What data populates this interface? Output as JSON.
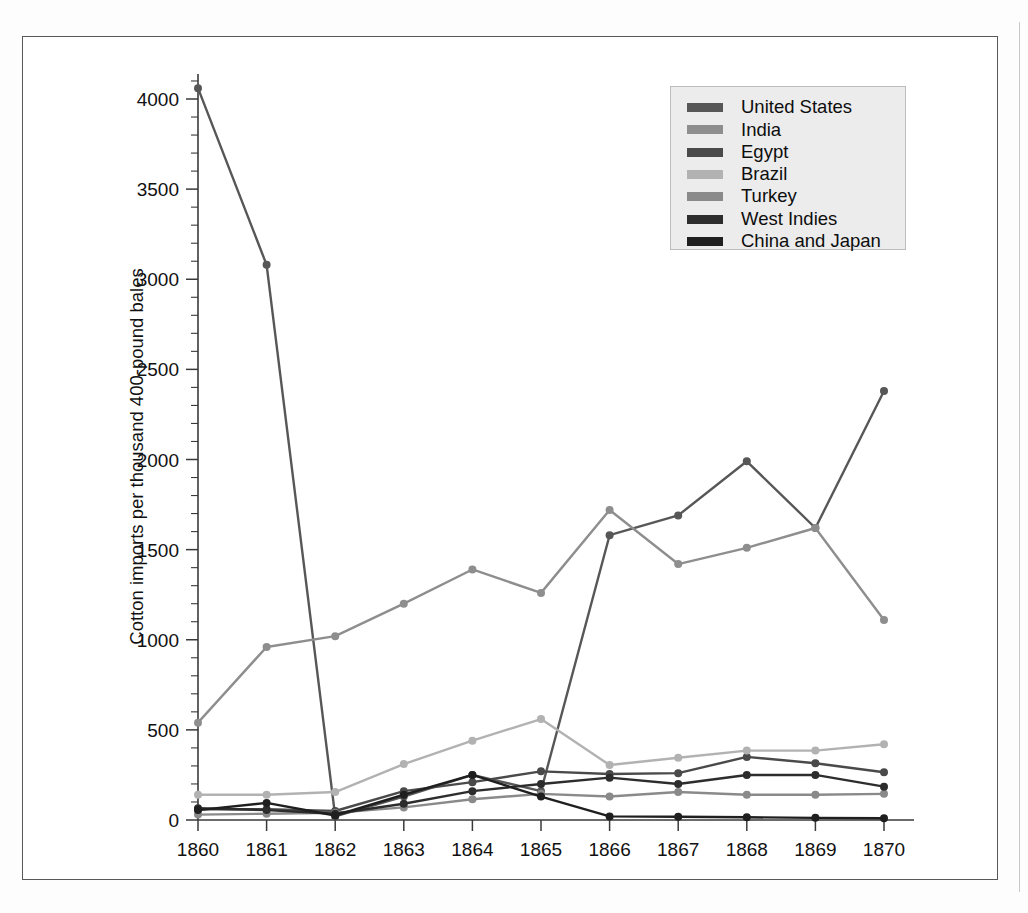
{
  "figure": {
    "frame_color": "#58595b",
    "background": "#ffffff"
  },
  "legend": {
    "position": "top-right",
    "background": "#ececec",
    "border": "#bdbdbd",
    "entries": [
      {
        "label": "United States",
        "color": "#575757"
      },
      {
        "label": "India",
        "color": "#8e8e8e"
      },
      {
        "label": "Egypt",
        "color": "#4a4a4a"
      },
      {
        "label": "Brazil",
        "color": "#b2b2b2"
      },
      {
        "label": "Turkey",
        "color": "#8a8a8a"
      },
      {
        "label": "West Indies",
        "color": "#2d2d2d"
      },
      {
        "label": "China and Japan",
        "color": "#1f1f1f"
      }
    ]
  },
  "axes": {
    "y_title": "Cotton imports per thousand 400-pound bales",
    "y_ticks": [
      "0",
      "500",
      "1000",
      "1500",
      "2000",
      "2500",
      "3000",
      "3500",
      "4000"
    ],
    "x_ticks": [
      "1860",
      "1861",
      "1862",
      "1863",
      "1864",
      "1865",
      "1866",
      "1867",
      "1868",
      "1869",
      "1870"
    ]
  },
  "chart_data": {
    "type": "line",
    "title": "",
    "xlabel": "",
    "ylabel": "Cotton imports per thousand 400-pound bales",
    "categories": [
      "1860",
      "1861",
      "1862",
      "1863",
      "1864",
      "1865",
      "1866",
      "1867",
      "1868",
      "1869",
      "1870"
    ],
    "x": [
      1860,
      1861,
      1862,
      1863,
      1864,
      1865,
      1866,
      1867,
      1868,
      1869,
      1870
    ],
    "xlim": [
      1860,
      1870
    ],
    "ylim": [
      0,
      4200
    ],
    "y_tick_step": 500,
    "y_minor_tick_step": 100,
    "grid": false,
    "legend_position": "upper right",
    "series": [
      {
        "name": "United States",
        "color": "#575757",
        "values": [
          4060,
          3080,
          20,
          130,
          250,
          160,
          1580,
          1690,
          1990,
          1620,
          2380
        ]
      },
      {
        "name": "India",
        "color": "#8e8e8e",
        "values": [
          540,
          960,
          1020,
          1200,
          1390,
          1260,
          1720,
          1420,
          1510,
          1620,
          1110
        ]
      },
      {
        "name": "Egypt",
        "color": "#4a4a4a",
        "values": [
          60,
          60,
          50,
          160,
          210,
          270,
          255,
          260,
          350,
          315,
          265
        ]
      },
      {
        "name": "Brazil",
        "color": "#b2b2b2",
        "values": [
          140,
          140,
          155,
          310,
          440,
          560,
          305,
          345,
          385,
          385,
          420
        ]
      },
      {
        "name": "Turkey",
        "color": "#8a8a8a",
        "values": [
          30,
          35,
          40,
          70,
          115,
          145,
          130,
          155,
          140,
          140,
          145
        ]
      },
      {
        "name": "West Indies",
        "color": "#2d2d2d",
        "values": [
          65,
          55,
          35,
          90,
          160,
          200,
          235,
          200,
          250,
          250,
          185
        ]
      },
      {
        "name": "China and Japan",
        "color": "#1f1f1f",
        "values": [
          55,
          95,
          25,
          140,
          250,
          130,
          20,
          18,
          15,
          12,
          10
        ]
      }
    ]
  }
}
